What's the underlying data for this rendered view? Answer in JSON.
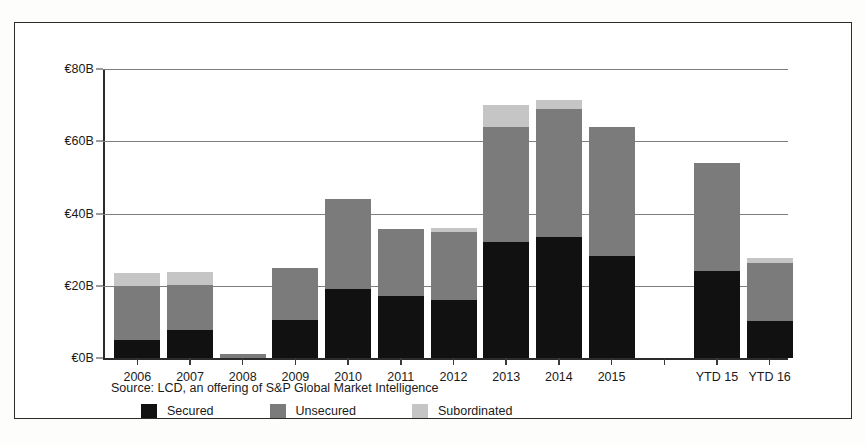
{
  "chart_data": {
    "type": "bar",
    "subtype": "stacked-bar",
    "title": "",
    "xlabel": "",
    "ylabel": "",
    "ylim": [
      0,
      80
    ],
    "y_unit": "€B",
    "grid": true,
    "legend_position": "bottom",
    "categories": [
      "2006",
      "2007",
      "2008",
      "2009",
      "2010",
      "2011",
      "2012",
      "2013",
      "2014",
      "2015",
      "",
      "YTD 15",
      "YTD 16"
    ],
    "ytick_labels": [
      "€80B",
      "€60B",
      "€40B",
      "€20B",
      "€0B"
    ],
    "ytick_values": [
      80,
      60,
      40,
      20,
      0
    ],
    "series": [
      {
        "name": "Secured",
        "color": "#111111",
        "values": [
          5.0,
          7.7,
          0.0,
          10.5,
          19.0,
          17.1,
          16.0,
          32.0,
          33.5,
          28.3,
          null,
          24.0,
          10.2
        ]
      },
      {
        "name": "Unsecured",
        "color": "#7b7b7b",
        "values": [
          15.0,
          12.5,
          1.1,
          14.3,
          25.0,
          18.5,
          19.0,
          32.0,
          35.5,
          35.7,
          null,
          30.1,
          16.0
        ]
      },
      {
        "name": "Subordinated",
        "color": "#c5c5c5",
        "values": [
          3.5,
          3.6,
          0.0,
          0.0,
          0.0,
          0.0,
          1.0,
          6.0,
          2.5,
          0.0,
          null,
          0.0,
          1.4
        ]
      }
    ],
    "totals": [
      23.5,
      23.8,
      1.1,
      24.8,
      44.0,
      35.6,
      36.0,
      70.0,
      71.5,
      64.0,
      null,
      54.1,
      27.6
    ],
    "source_note": "Source: LCD, an offering of S&P Global Market Intelligence"
  },
  "legend": {
    "items": [
      {
        "label": "Secured",
        "color": "#111111"
      },
      {
        "label": "Unsecured",
        "color": "#7b7b7b"
      },
      {
        "label": "Subordinated",
        "color": "#c5c5c5"
      }
    ]
  }
}
